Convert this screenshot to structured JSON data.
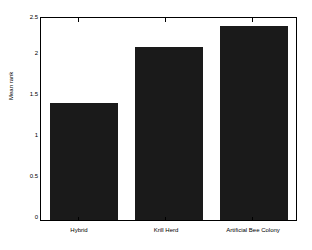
{
  "chart_data": {
    "type": "bar",
    "title": "",
    "xlabel": "",
    "ylabel": "Mean rank",
    "categories": [
      "Hybrid",
      "Krill Herd",
      "Artificial Bee Colony"
    ],
    "values": [
      1.45,
      2.14,
      2.4
    ],
    "ylim": [
      0,
      2.5
    ],
    "ytick_labels": [
      "0",
      "0.5",
      "1",
      "1.5",
      "2",
      "2.5"
    ],
    "ytick_values": [
      0,
      0.5,
      1,
      1.5,
      2,
      2.5
    ],
    "grid": false,
    "legend": null,
    "bar_color": "#1a1a1a",
    "axes_color": "#000000",
    "background": "#ffffff"
  }
}
